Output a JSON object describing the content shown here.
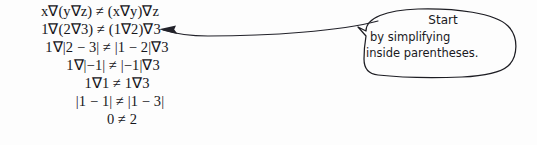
{
  "page": {
    "background_color": "#fdfdfd",
    "ink_color": "#16161a"
  },
  "derivation": {
    "name": "associativity-counterexample",
    "lines": [
      "x∇(y∇z) ≠ (x∇y)∇z",
      "1∇(2∇3) ≠ (1∇2)∇3",
      "1∇|2 − 3| ≠ |1 − 2|∇3",
      "1∇|−1| ≠ |−1|∇3",
      "1∇1 ≠ 1∇3",
      "|1 − 1| ≠ |1 − 3|",
      "0 ≠ 2"
    ]
  },
  "annotation": {
    "name": "hand-drawn-callout",
    "arrow_icon": "left-arrow-icon",
    "bubble_icon": "speech-bubble-icon",
    "points_to_line_index": 1,
    "text_lines": [
      "Start",
      "by simplifying",
      "inside parentheses."
    ]
  }
}
